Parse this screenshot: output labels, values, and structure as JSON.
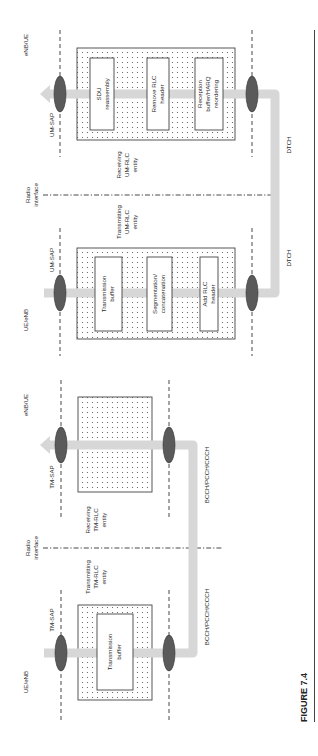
{
  "figure": {
    "caption": "FIGURE 7.4"
  },
  "um_mode": {
    "left_node": "UE/eNB",
    "right_node": "eNB/UE",
    "radio_interface": [
      "Radio",
      "interface"
    ],
    "transmitting_entity": [
      "Transmitting",
      "UM-RLC",
      "entity"
    ],
    "receiving_entity": [
      "Receiving",
      "UM-RLC",
      "entity"
    ],
    "sap_tx": "UM-SAP",
    "sap_rx": "UM-SAP",
    "channel_tx": "DTCH",
    "channel_rx": "DTCH",
    "tx_functions": [
      [
        "Transmission",
        "buffer"
      ],
      [
        "Segmentation/",
        "concatenation"
      ],
      [
        "Add RLC",
        "header"
      ]
    ],
    "rx_functions": [
      [
        "Reception",
        "buffer/HARQ",
        "reordering"
      ],
      [
        "Remove RLC",
        "header"
      ],
      [
        "SDU",
        "reassembly"
      ]
    ]
  },
  "tm_mode": {
    "left_node": "UE/eNB",
    "right_node": "eNB/UE",
    "radio_interface": [
      "Radio",
      "interface"
    ],
    "transmitting_entity": [
      "Transmitting",
      "TM-RLC",
      "entity"
    ],
    "receiving_entity": [
      "Receiving",
      "TM-RLC",
      "entity"
    ],
    "sap_tx": "TM-SAP",
    "sap_rx": "TM-SAP",
    "channel_tx": "BCCH/PCCH/CCCH",
    "channel_rx": "BCCH/PCCH/CCCH",
    "tx_functions": [
      [
        "Transmission",
        "buffer"
      ]
    ]
  },
  "colors": {
    "pipe": "#d7d7d7",
    "sap_ellipse": "#5a5a5a",
    "line": "#333333"
  }
}
